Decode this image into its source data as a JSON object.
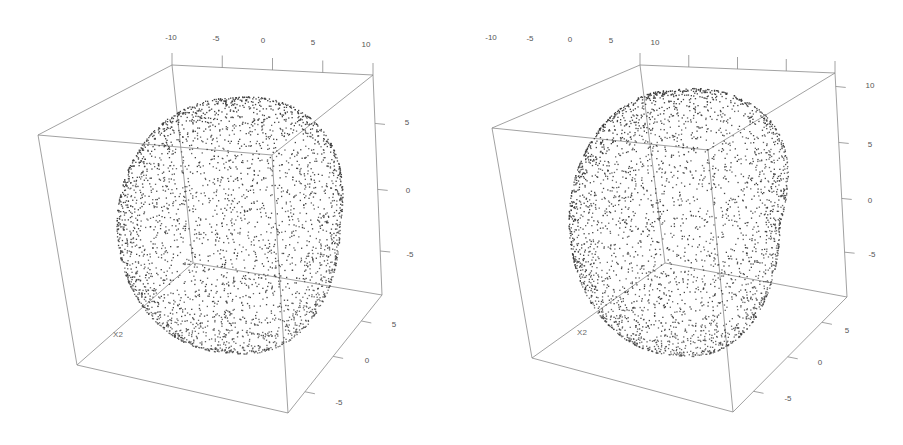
{
  "chart_data": [
    {
      "type": "scatter3d",
      "title": "",
      "description": "3D point cloud of a rounded blob/ellipsoid-like surface, viewed in a bounding box",
      "axes": {
        "x": {
          "label": "",
          "ticks": [
            "-10",
            "-5",
            "0",
            "5",
            "10"
          ],
          "range": [
            -10,
            10
          ]
        },
        "y": {
          "label": "X2",
          "ticks": [
            "-5",
            "0",
            "5"
          ],
          "range": [
            -7,
            7
          ]
        },
        "z": {
          "label": "",
          "ticks": [
            "-5",
            "0",
            "5"
          ],
          "range": [
            -8,
            8
          ]
        }
      },
      "point_color": "#3a3a3a",
      "box_color": "#8a8a8a",
      "approx_point_count": 3000
    },
    {
      "type": "scatter3d",
      "title": "",
      "description": "3D point cloud of same surface from slightly different rotation, more elongated to upper right",
      "axes": {
        "x": {
          "label": "",
          "ticks": [
            "-10",
            "-5",
            "0",
            "5",
            "10"
          ],
          "range": [
            -10,
            10
          ]
        },
        "y": {
          "label": "X2",
          "ticks": [
            "-5",
            "0",
            "5"
          ],
          "range": [
            -7,
            7
          ]
        },
        "z": {
          "label": "",
          "ticks": [
            "-5",
            "0",
            "5",
            "10"
          ],
          "range": [
            -8,
            11
          ]
        }
      },
      "point_color": "#3a3a3a",
      "box_color": "#8a8a8a",
      "approx_point_count": 3000
    }
  ],
  "panels": [
    {
      "top_ticks": [
        {
          "label": "-10",
          "x": 171,
          "y": 37
        },
        {
          "label": "-5",
          "x": 216,
          "y": 38
        },
        {
          "label": "0",
          "x": 263,
          "y": 40
        },
        {
          "label": "5",
          "x": 313,
          "y": 42
        },
        {
          "label": "10",
          "x": 366,
          "y": 44
        }
      ],
      "right_ticks": [
        {
          "label": "5",
          "x": 407,
          "y": 122
        },
        {
          "label": "0",
          "x": 408,
          "y": 190
        },
        {
          "label": "-5",
          "x": 410,
          "y": 254
        }
      ],
      "bottom_ticks": [
        {
          "label": "5",
          "x": 394,
          "y": 324
        },
        {
          "label": "0",
          "x": 367,
          "y": 360
        },
        {
          "label": "-5",
          "x": 339,
          "y": 402
        }
      ],
      "y_axis_label": {
        "label": "X2",
        "x": 118,
        "y": 334
      }
    },
    {
      "top_ticks": [
        {
          "label": "-10",
          "x": 491,
          "y": 37
        },
        {
          "label": "-5",
          "x": 530,
          "y": 38
        },
        {
          "label": "0",
          "x": 570,
          "y": 39
        },
        {
          "label": "5",
          "x": 611,
          "y": 40
        },
        {
          "label": "10",
          "x": 655,
          "y": 42
        }
      ],
      "right_ticks": [
        {
          "label": "10",
          "x": 420,
          "y": 85
        },
        {
          "label": "5",
          "x": 420,
          "y": 144
        },
        {
          "label": "0",
          "x": 420,
          "y": 200
        },
        {
          "label": "-5",
          "x": 422,
          "y": 254
        }
      ],
      "bottom_ticks": [
        {
          "label": "5",
          "x": 397,
          "y": 330
        },
        {
          "label": "0",
          "x": 370,
          "y": 362
        },
        {
          "label": "-5",
          "x": 338,
          "y": 398
        }
      ],
      "y_axis_label": {
        "label": "X2",
        "x": 132,
        "y": 332
      }
    }
  ]
}
